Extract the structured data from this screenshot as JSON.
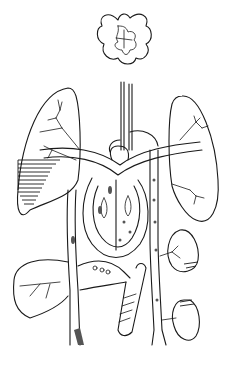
{
  "diagram": {
    "type": "anatomical-line-drawing",
    "colors": {
      "background": "#ffffff",
      "line": "#1a1a1a",
      "shading": "#555555"
    },
    "parts": [
      {
        "id": "brain",
        "label": ""
      },
      {
        "id": "right-lung",
        "label": ""
      },
      {
        "id": "left-lung",
        "label": ""
      },
      {
        "id": "heart",
        "label": ""
      },
      {
        "id": "aorta",
        "label": ""
      },
      {
        "id": "liver",
        "label": ""
      },
      {
        "id": "intestine",
        "label": ""
      },
      {
        "id": "spleen",
        "label": ""
      },
      {
        "id": "kidney",
        "label": ""
      },
      {
        "id": "vena-cava",
        "label": ""
      }
    ]
  }
}
